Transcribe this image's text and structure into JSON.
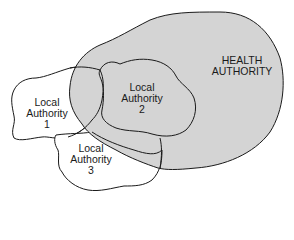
{
  "diagram": {
    "type": "overlapping-regions",
    "colors": {
      "health_fill": "#d4d4d4",
      "outline": "#1a1a1a",
      "local_fill": "#ffffff"
    },
    "regions": [
      {
        "id": "health",
        "label_line1": "HEALTH",
        "label_line2": "AUTHORITY",
        "shaded": true
      },
      {
        "id": "la1",
        "label_line1": "Local",
        "label_line2": "Authority",
        "label_line3": "1"
      },
      {
        "id": "la2",
        "label_line1": "Local",
        "label_line2": "Authority",
        "label_line3": "2"
      },
      {
        "id": "la3",
        "label_line1": "Local",
        "label_line2": "Authority",
        "label_line3": "3"
      }
    ]
  }
}
